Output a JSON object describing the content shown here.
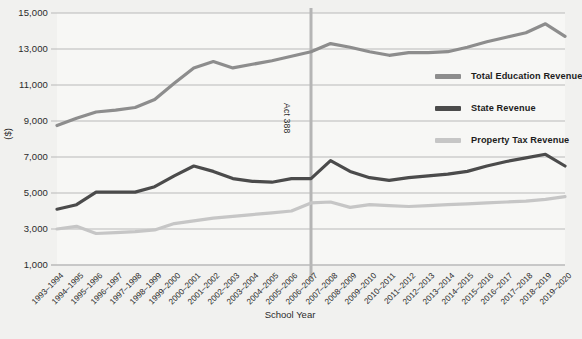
{
  "chart_data": {
    "type": "line",
    "title": "",
    "xlabel": "School Year",
    "ylabel": "($)",
    "ylim": [
      1000,
      15000
    ],
    "ytick_labels": [
      "15,000",
      "13,000",
      "11,000",
      "9,000",
      "7,000",
      "5,000",
      "3,000",
      "1,000"
    ],
    "ytick_values": [
      15000,
      13000,
      11000,
      9000,
      7000,
      5000,
      3000,
      1000
    ],
    "grid": true,
    "legend_position": "right-inside",
    "categories": [
      "1993–1994",
      "1994–1995",
      "1995–1996",
      "1996–1997",
      "1997–1998",
      "1998–1999",
      "1999–2000",
      "2000–2001",
      "2001–2002",
      "2002–2003",
      "2003–2004",
      "2004–2005",
      "2005–2006",
      "2006–2007",
      "2007–2008",
      "2008–2009",
      "2009–2010",
      "2010–2011",
      "2011–2012",
      "2012–2013",
      "2013–2014",
      "2014–2015",
      "2015–2016",
      "2016–2017",
      "2017–2018",
      "2018–2019",
      "2019–2020"
    ],
    "series": [
      {
        "name": "Total Education Revenue",
        "color": "#8d8d8d",
        "values": [
          8750,
          9150,
          9500,
          9600,
          9750,
          10200,
          11100,
          11950,
          12300,
          11950,
          12150,
          12350,
          12600,
          12850,
          13300,
          13100,
          12850,
          12650,
          12800,
          12800,
          12850,
          13100,
          13400,
          13650,
          13900,
          14400,
          13700
        ]
      },
      {
        "name": "State Revenue",
        "color": "#4b4b4b",
        "values": [
          4100,
          4350,
          5050,
          5050,
          5050,
          5350,
          5950,
          6500,
          6200,
          5800,
          5650,
          5600,
          5800,
          5800,
          6800,
          6200,
          5850,
          5700,
          5850,
          5950,
          6050,
          6200,
          6500,
          6750,
          6950,
          7150,
          6500
        ]
      },
      {
        "name": "Property Tax Revenue",
        "color": "#c6c6c6",
        "values": [
          3000,
          3150,
          2750,
          2800,
          2850,
          2950,
          3300,
          3450,
          3600,
          3700,
          3800,
          3900,
          4000,
          4450,
          4500,
          4200,
          4350,
          4300,
          4250,
          4300,
          4350,
          4400,
          4450,
          4500,
          4550,
          4650,
          4800
        ]
      }
    ],
    "annotations": [
      {
        "label": "Act 388",
        "at_category": "2006–2007"
      }
    ]
  },
  "colors": {
    "background": "#f1f1ef",
    "plot_background": "#f7f7f5",
    "gridline": "#b9b9b9",
    "annotation_line": "#b5b5b5",
    "text": "#2b2b2b"
  }
}
